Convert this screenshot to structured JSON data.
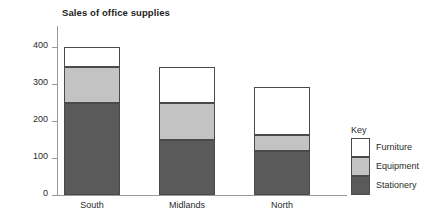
{
  "chart_data": {
    "type": "bar",
    "subtype": "stacked-bar",
    "title": "Sales of office supplies",
    "xlabel": "",
    "ylabel": "£000s",
    "categories": [
      "South",
      "Midlands",
      "North"
    ],
    "series": [
      {
        "name": "Stationery",
        "color": "#5a5a5a",
        "values": [
          250,
          150,
          118
        ]
      },
      {
        "name": "Equipment",
        "color": "#c3c3c3",
        "values": [
          97,
          100,
          45
        ]
      },
      {
        "name": "Furniture",
        "color": "#ffffff",
        "values": [
          53,
          95,
          129
        ]
      }
    ],
    "totals": [
      400,
      345,
      292
    ],
    "ylim": [
      0,
      400
    ],
    "yticks": [
      0,
      100,
      200,
      300,
      400
    ],
    "ytick_labels": [
      "0",
      "100",
      "200",
      "300",
      "400"
    ],
    "grid": false,
    "legend": {
      "title": "Key",
      "position": "right",
      "order": [
        "Furniture",
        "Equipment",
        "Stationery"
      ],
      "entries": [
        {
          "label": "Furniture",
          "color": "#ffffff"
        },
        {
          "label": "Equipment",
          "color": "#c3c3c3"
        },
        {
          "label": "Stationery",
          "color": "#5a5a5a"
        }
      ]
    }
  },
  "style": {
    "axis_color": "#9a9a9a",
    "outline_color": "#4a4a4a",
    "text_color": "#2b2b2b",
    "background": "#ffffff"
  }
}
